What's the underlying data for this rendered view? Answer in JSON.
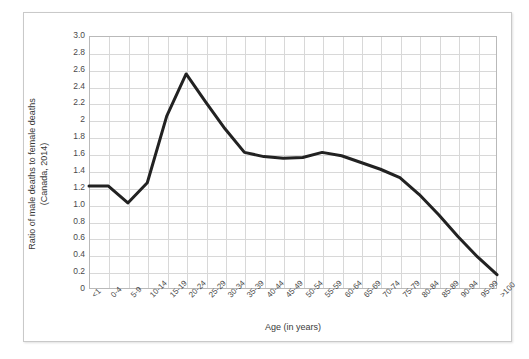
{
  "chart_data": {
    "type": "line",
    "title": "",
    "xlabel": "Age (in years)",
    "ylabel": "Ratio of male deaths to female deaths (Canada, 2014)",
    "ylabel_lines": [
      "Ratio of male deaths to female deaths",
      "(Canada, 2014)"
    ],
    "ylim": [
      0,
      3.0
    ],
    "ytick_values": [
      0,
      0.2,
      0.4,
      0.6,
      0.8,
      1.0,
      1.2,
      1.4,
      1.6,
      1.8,
      2,
      2.2,
      2.4,
      2.6,
      2.8,
      3.0
    ],
    "ytick_labels": [
      "0",
      "0.2",
      "0.4",
      "0.6",
      "0.8",
      "1.0",
      "1.2",
      "1.4",
      "1.6",
      "1.8",
      "2",
      "2.2",
      "2.4",
      "2.6",
      "2.8",
      "3.0"
    ],
    "grid": true,
    "legend": false,
    "line_color": "#222222",
    "categories": [
      "<1",
      "0-4",
      "5-9",
      "10-14",
      "15-19",
      "20-24",
      "25-29",
      "30-34",
      "35-39",
      "40-44",
      "45-49",
      "50-54",
      "55-59",
      "60-64",
      "65-69",
      "70-74",
      "75-79",
      "80-84",
      "85-89",
      "90-94",
      "95-99",
      ">100"
    ],
    "values": [
      1.22,
      1.22,
      1.02,
      1.26,
      2.05,
      2.55,
      2.22,
      1.9,
      1.62,
      1.57,
      1.55,
      1.56,
      1.62,
      1.58,
      1.5,
      1.42,
      1.32,
      1.12,
      0.88,
      0.62,
      0.38,
      0.17
    ]
  },
  "axis": {
    "x_title": "Age (in years)",
    "y_title_line1": "Ratio of male deaths to female deaths",
    "y_title_line2": "(Canada, 2014)"
  }
}
